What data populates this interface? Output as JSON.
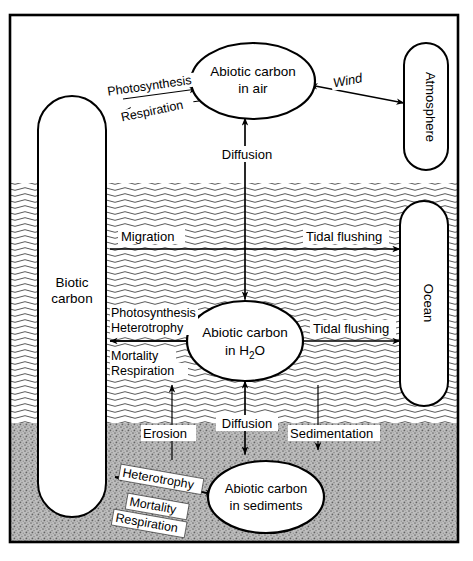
{
  "diagram": {
    "zones": [
      {
        "id": "air",
        "name": "air zone",
        "fill": "#ffffff"
      },
      {
        "id": "water",
        "name": "water zone",
        "fill": "#ffffff",
        "texture": "wavy-lines"
      },
      {
        "id": "sediments",
        "name": "sediment zone",
        "fill": "#b3b3b3",
        "texture": "stipple"
      }
    ],
    "nodes": [
      {
        "id": "abiotic_air",
        "shape": "ellipse",
        "line1": "Abiotic carbon",
        "line2": "in air"
      },
      {
        "id": "abiotic_water",
        "shape": "ellipse",
        "line1": "Abiotic carbon",
        "line2": "in H2O",
        "line2_sub": "2"
      },
      {
        "id": "abiotic_sediments",
        "shape": "ellipse",
        "line1": "Abiotic carbon",
        "line2": "in sediments"
      },
      {
        "id": "biotic_carbon",
        "shape": "stadium",
        "line1": "Biotic",
        "line2": "carbon"
      },
      {
        "id": "atmosphere",
        "shape": "stadium",
        "line1": "Atmosphere",
        "orientation": "vertical"
      },
      {
        "id": "ocean",
        "shape": "stadium",
        "line1": "Ocean",
        "orientation": "vertical"
      }
    ],
    "flows": [
      {
        "id": "photosynthesis_air",
        "label": "Photosynthesis",
        "from": "abiotic_air",
        "to": "biotic_carbon",
        "arrow": "single",
        "rotated": true
      },
      {
        "id": "respiration_air",
        "label": "Respiration",
        "from": "biotic_carbon",
        "to": "abiotic_air",
        "arrow": "single",
        "rotated": true
      },
      {
        "id": "wind",
        "label": "Wind",
        "from": "atmosphere",
        "to": "abiotic_air",
        "arrow": "double",
        "rotated": true
      },
      {
        "id": "diffusion_air",
        "label": "Diffusion",
        "from": "abiotic_water",
        "to": "abiotic_air",
        "arrow": "single"
      },
      {
        "id": "migration",
        "label": "Migration",
        "from": "biotic_carbon",
        "to": "ocean",
        "arrow": "single"
      },
      {
        "id": "tidal_flushing_top",
        "label": "Tidal flushing",
        "from": "biotic_carbon",
        "to": "ocean",
        "arrow": "single"
      },
      {
        "id": "photosynthesis_h2o",
        "label": "Photosynthesis",
        "from": "abiotic_water",
        "to": "biotic_carbon",
        "arrow": "single"
      },
      {
        "id": "heterotrophy_h2o",
        "label": "Heterotrophy",
        "from": "abiotic_water",
        "to": "biotic_carbon",
        "arrow": "single"
      },
      {
        "id": "mortality_h2o",
        "label": "Mortality",
        "from": "biotic_carbon",
        "to": "abiotic_water",
        "arrow": "single"
      },
      {
        "id": "respiration_h2o",
        "label": "Respiration",
        "from": "biotic_carbon",
        "to": "abiotic_water",
        "arrow": "single"
      },
      {
        "id": "tidal_flushing_mid",
        "label": "Tidal flushing",
        "from": "abiotic_water",
        "to": "ocean",
        "arrow": "single"
      },
      {
        "id": "erosion",
        "label": "Erosion",
        "from": "abiotic_sediments",
        "to": "abiotic_water",
        "arrow": "single"
      },
      {
        "id": "diffusion_sed",
        "label": "Diffusion",
        "from": "abiotic_water",
        "to": "abiotic_sediments",
        "arrow": "double"
      },
      {
        "id": "sedimentation",
        "label": "Sedimentation",
        "from": "abiotic_water",
        "to": "abiotic_sediments",
        "arrow": "single"
      },
      {
        "id": "heterotrophy_sed",
        "label": "Heterotrophy",
        "from": "abiotic_sediments",
        "to": "biotic_carbon",
        "arrow": "single",
        "rotated": true
      },
      {
        "id": "mortality_sed",
        "label": "Mortality",
        "from": "biotic_carbon",
        "to": "abiotic_sediments",
        "arrow": "single",
        "rotated": true
      },
      {
        "id": "respiration_sed",
        "label": "Respiration",
        "from": "biotic_carbon",
        "to": "abiotic_sediments",
        "arrow": "single",
        "rotated": true
      }
    ],
    "colors": {
      "stroke": "#000000",
      "background": "#ffffff",
      "sediment": "#b3b3b3",
      "water_line": "#555555"
    }
  }
}
